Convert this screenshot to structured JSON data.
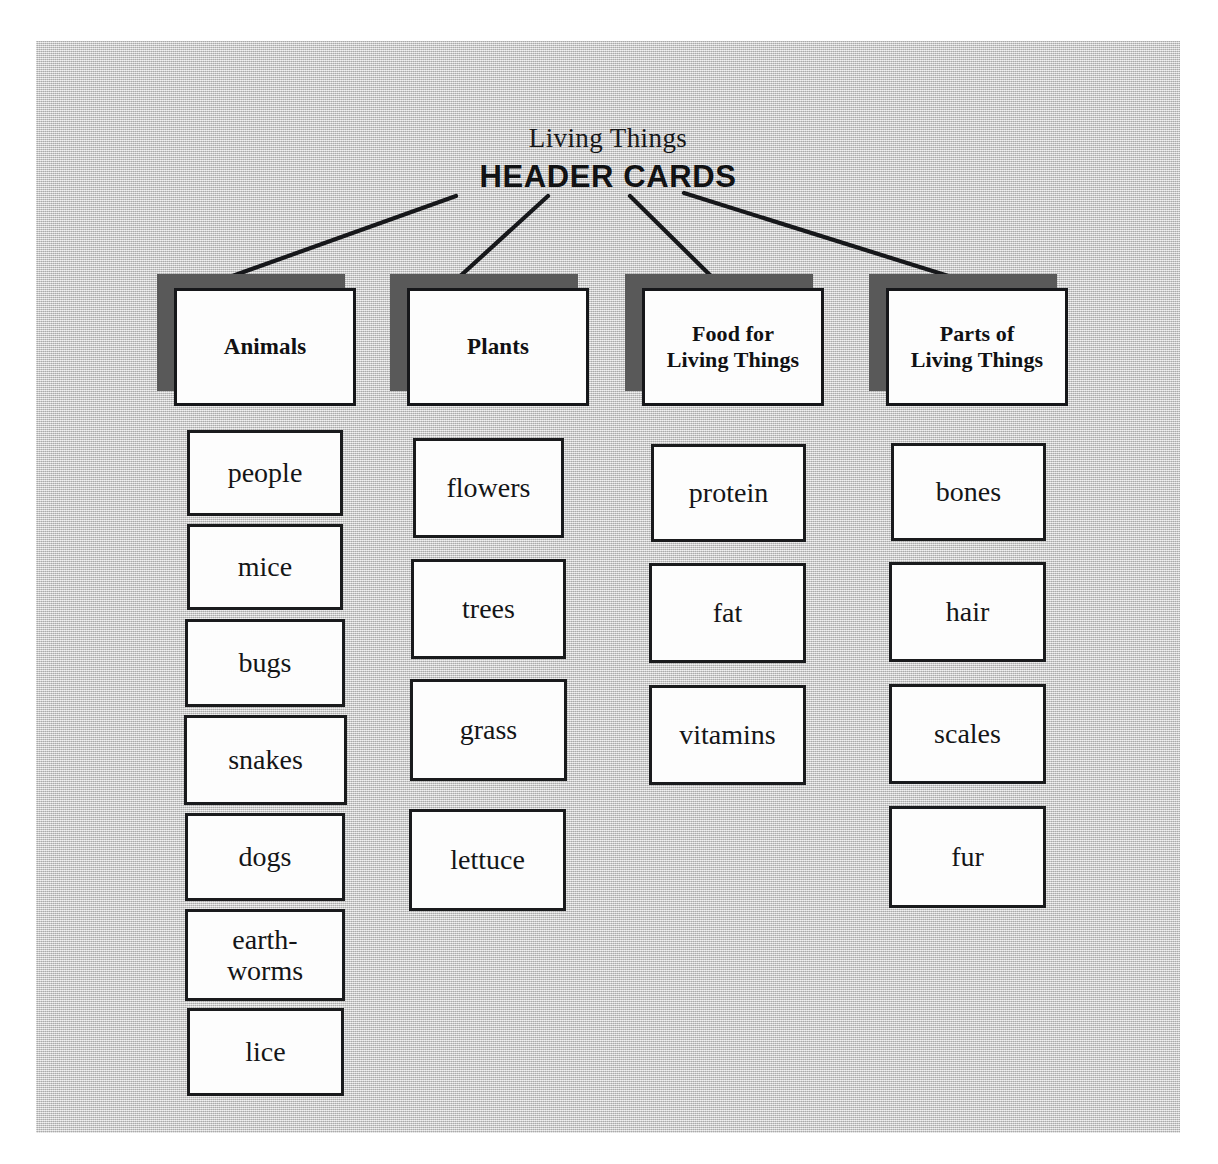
{
  "document": {
    "title": "Living Things",
    "section_label": "HEADER CARDS"
  },
  "colors": {
    "panel_background": "#c9c9c9",
    "card_face": "#fdfdfd",
    "card_border": "#1a1b1d",
    "card_stack_shadow": "#595959",
    "ink": "#16171a"
  },
  "columns": [
    {
      "header": "Animals",
      "header_lines": [
        "Animals"
      ],
      "cards": [
        {
          "label": "people"
        },
        {
          "label": "mice"
        },
        {
          "label": "bugs"
        },
        {
          "label": "snakes"
        },
        {
          "label": "dogs"
        },
        {
          "label": "earth-\nworms"
        },
        {
          "label": "lice"
        }
      ]
    },
    {
      "header": "Plants",
      "header_lines": [
        "Plants"
      ],
      "cards": [
        {
          "label": "flowers"
        },
        {
          "label": "trees"
        },
        {
          "label": "grass"
        },
        {
          "label": "lettuce"
        }
      ]
    },
    {
      "header": "Food for\nLiving Things",
      "header_lines": [
        "Food for",
        "Living Things"
      ],
      "cards": [
        {
          "label": "protein"
        },
        {
          "label": "fat"
        },
        {
          "label": "vitamins"
        }
      ]
    },
    {
      "header": "Parts of\nLiving Things",
      "header_lines": [
        "Parts of",
        "Living Things"
      ],
      "cards": [
        {
          "label": "bones"
        },
        {
          "label": "hair"
        },
        {
          "label": "scales"
        },
        {
          "label": "fur"
        }
      ]
    }
  ],
  "connectors": [
    {
      "from": "header-cards-title",
      "to": "column-1-header"
    },
    {
      "from": "header-cards-title",
      "to": "column-2-header"
    },
    {
      "from": "header-cards-title",
      "to": "column-3-header"
    },
    {
      "from": "header-cards-title",
      "to": "column-4-header"
    }
  ]
}
